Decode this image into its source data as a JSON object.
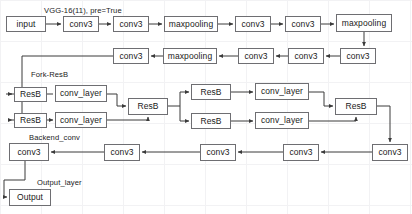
{
  "diagram": {
    "background_color": "#ffffff",
    "grid_color": "#f2f2f4",
    "box_border_color": "#6e6e72",
    "box_fill_color": "#ffffff",
    "wire_color": "#3a3a3a"
  },
  "group_labels": [
    {
      "id": "vgg",
      "text": "VGG-16(11), pre=True",
      "x": 44,
      "y": 6
    },
    {
      "id": "fork",
      "text": "Fork-ResB",
      "x": 31,
      "y": 70
    },
    {
      "id": "backend",
      "text": "Backend_conv",
      "x": 29,
      "y": 133
    },
    {
      "id": "output",
      "text": "Output_layer",
      "x": 37,
      "y": 178
    }
  ],
  "nodes": [
    {
      "id": "input",
      "label": "input",
      "x": 6,
      "y": 16,
      "w": 40,
      "h": 16,
      "row": "vgg"
    },
    {
      "id": "conv3_1",
      "label": "conv3",
      "x": 63,
      "y": 16,
      "w": 36,
      "h": 16,
      "row": "vgg"
    },
    {
      "id": "conv3_2",
      "label": "conv3",
      "x": 113,
      "y": 16,
      "w": 36,
      "h": 16,
      "row": "vgg"
    },
    {
      "id": "maxpool_1",
      "label": "maxpooling",
      "x": 164,
      "y": 16,
      "w": 54,
      "h": 16,
      "row": "vgg"
    },
    {
      "id": "conv3_3",
      "label": "conv3",
      "x": 235,
      "y": 16,
      "w": 36,
      "h": 16,
      "row": "vgg"
    },
    {
      "id": "conv3_4",
      "label": "conv3",
      "x": 285,
      "y": 16,
      "w": 36,
      "h": 16,
      "row": "vgg"
    },
    {
      "id": "maxpool_2",
      "label": "maxpooling",
      "x": 336,
      "y": 14,
      "w": 56,
      "h": 18,
      "row": "vgg"
    },
    {
      "id": "conv3_5",
      "label": "conv3",
      "x": 340,
      "y": 48,
      "w": 36,
      "h": 16,
      "row": "vgg2"
    },
    {
      "id": "conv3_6",
      "label": "conv3",
      "x": 288,
      "y": 48,
      "w": 36,
      "h": 16,
      "row": "vgg2"
    },
    {
      "id": "conv3_7",
      "label": "conv3",
      "x": 238,
      "y": 48,
      "w": 36,
      "h": 16,
      "row": "vgg2"
    },
    {
      "id": "maxpool_3",
      "label": "maxpooling",
      "x": 163,
      "y": 48,
      "w": 54,
      "h": 16,
      "row": "vgg2"
    },
    {
      "id": "conv3_8",
      "label": "conv3",
      "x": 113,
      "y": 48,
      "w": 36,
      "h": 16,
      "row": "vgg2"
    },
    {
      "id": "resb_a",
      "label": "ResB",
      "x": 14,
      "y": 87,
      "w": 33,
      "h": 15,
      "row": "fork"
    },
    {
      "id": "convl_a",
      "label": "conv_layer",
      "x": 55,
      "y": 85,
      "w": 52,
      "h": 17,
      "row": "fork"
    },
    {
      "id": "resb_b",
      "label": "ResB",
      "x": 14,
      "y": 113,
      "w": 33,
      "h": 15,
      "row": "fork"
    },
    {
      "id": "convl_b",
      "label": "conv_layer",
      "x": 55,
      "y": 112,
      "w": 52,
      "h": 16,
      "row": "fork"
    },
    {
      "id": "resb_mid",
      "label": "ResB",
      "x": 128,
      "y": 98,
      "w": 40,
      "h": 17,
      "row": "fork"
    },
    {
      "id": "resb_c",
      "label": "ResB",
      "x": 191,
      "y": 84,
      "w": 40,
      "h": 16,
      "row": "fork"
    },
    {
      "id": "convl_c",
      "label": "conv_layer",
      "x": 255,
      "y": 83,
      "w": 54,
      "h": 17,
      "row": "fork"
    },
    {
      "id": "resb_d",
      "label": "ResB",
      "x": 191,
      "y": 113,
      "w": 40,
      "h": 16,
      "row": "fork"
    },
    {
      "id": "convl_d",
      "label": "conv_layer",
      "x": 255,
      "y": 112,
      "w": 54,
      "h": 17,
      "row": "fork"
    },
    {
      "id": "resb_out",
      "label": "ResB",
      "x": 335,
      "y": 98,
      "w": 42,
      "h": 17,
      "row": "fork"
    },
    {
      "id": "bconv_5",
      "label": "conv3",
      "x": 372,
      "y": 144,
      "w": 36,
      "h": 17,
      "row": "backend"
    },
    {
      "id": "bconv_4",
      "label": "conv3",
      "x": 283,
      "y": 144,
      "w": 36,
      "h": 17,
      "row": "backend"
    },
    {
      "id": "bconv_3",
      "label": "conv3",
      "x": 200,
      "y": 144,
      "w": 36,
      "h": 17,
      "row": "backend"
    },
    {
      "id": "bconv_2",
      "label": "conv3",
      "x": 104,
      "y": 144,
      "w": 36,
      "h": 17,
      "row": "backend"
    },
    {
      "id": "bconv_1",
      "label": "conv3",
      "x": 9,
      "y": 143,
      "w": 40,
      "h": 18,
      "row": "backend"
    },
    {
      "id": "output",
      "label": "Output",
      "x": 9,
      "y": 189,
      "w": 42,
      "h": 17,
      "row": "output"
    }
  ]
}
